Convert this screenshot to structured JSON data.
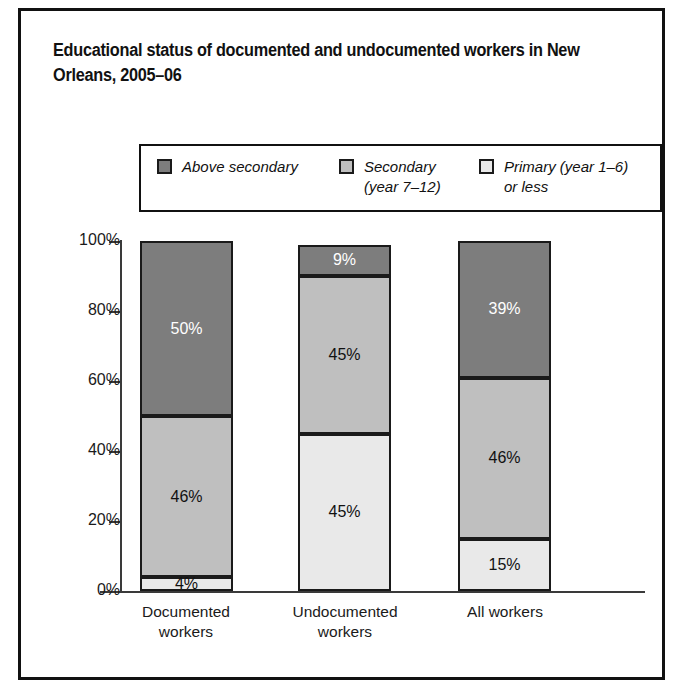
{
  "figure": {
    "title": "Educational status of documented and undocumented workers in New Orleans, 2005–06"
  },
  "legend": {
    "position": "top-inside",
    "items": [
      {
        "label": "Above secondary",
        "color": "#7d7d7d",
        "name": "above-secondary"
      },
      {
        "label": "Secondary\n(year 7–12)",
        "color": "#bfbfbf",
        "name": "secondary"
      },
      {
        "label": "Primary (year 1–6)\nor less",
        "color": "#e9e9e9",
        "name": "primary-or-less"
      }
    ]
  },
  "axes": {
    "y_ticks": [
      "0%",
      "20%",
      "40%",
      "60%",
      "80%",
      "100%"
    ],
    "x_labels": [
      "Documented\nworkers",
      "Undocumented\nworkers",
      "All workers"
    ]
  },
  "bars": [
    {
      "category": "Documented workers",
      "segments": [
        {
          "label": "50%",
          "value": 50,
          "series": "Above secondary",
          "text_color": "#ffffff"
        },
        {
          "label": "46%",
          "value": 46,
          "series": "Secondary (year 7–12)",
          "text_color": "#111111"
        },
        {
          "label": "4%",
          "value": 4,
          "series": "Primary (year 1–6) or less",
          "text_color": "#111111"
        }
      ]
    },
    {
      "category": "Undocumented workers",
      "segments": [
        {
          "label": "9%",
          "value": 9,
          "series": "Above secondary",
          "text_color": "#ffffff"
        },
        {
          "label": "45%",
          "value": 45,
          "series": "Secondary (year 7–12)",
          "text_color": "#111111"
        },
        {
          "label": "45%",
          "value": 45,
          "series": "Primary (year 1–6) or less",
          "text_color": "#111111"
        }
      ]
    },
    {
      "category": "All workers",
      "segments": [
        {
          "label": "39%",
          "value": 39,
          "series": "Above secondary",
          "text_color": "#ffffff"
        },
        {
          "label": "46%",
          "value": 46,
          "series": "Secondary (year 7–12)",
          "text_color": "#111111"
        },
        {
          "label": "15%",
          "value": 15,
          "series": "Primary (year 1–6) or less",
          "text_color": "#111111"
        }
      ]
    }
  ],
  "chart_data": {
    "type": "bar",
    "subtype": "stacked-100-percent",
    "title": "Educational status of documented and undocumented workers in New Orleans, 2005–06",
    "xlabel": "",
    "ylabel": "",
    "ylim": [
      0,
      100
    ],
    "ytick_labels": [
      "0%",
      "20%",
      "40%",
      "60%",
      "80%",
      "100%"
    ],
    "ytick_values": [
      0,
      20,
      40,
      60,
      80,
      100
    ],
    "grid": false,
    "legend_position": "top-inside",
    "categories": [
      "Documented workers",
      "Undocumented workers",
      "All workers"
    ],
    "series": [
      {
        "name": "Above secondary",
        "color": "#7d7d7d",
        "values": [
          50,
          9,
          39
        ],
        "labels": [
          "50%",
          "9%",
          "39%"
        ]
      },
      {
        "name": "Secondary (year 7–12)",
        "color": "#bfbfbf",
        "values": [
          46,
          45,
          46
        ],
        "labels": [
          "46%",
          "45%",
          "46%"
        ]
      },
      {
        "name": "Primary (year 1–6) or less",
        "color": "#e9e9e9",
        "values": [
          4,
          45,
          15
        ],
        "labels": [
          "4%",
          "45%",
          "15%"
        ]
      }
    ]
  },
  "style": {
    "bar_border": "#1a1a1a",
    "axis_color": "#3a3a3a",
    "frame_color": "#111111",
    "background": "#ffffff"
  }
}
